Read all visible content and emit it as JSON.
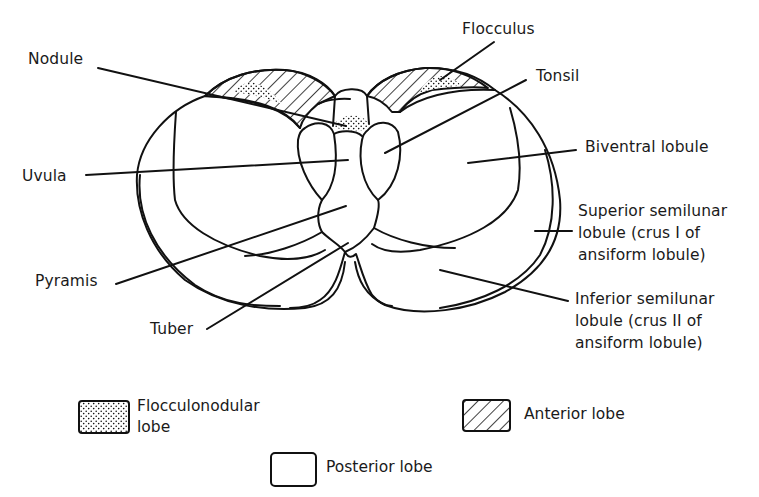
{
  "figure": {
    "labels": {
      "nodule": "Nodule",
      "flocculus": "Flocculus",
      "tonsil": "Tonsil",
      "biventral": "Biventral lobule",
      "uvula": "Uvula",
      "superior_semilunar": [
        "Superior semilunar",
        "lobule (crus I of",
        "ansiform lobule)"
      ],
      "pyramis": "Pyramis",
      "inferior_semilunar": [
        "Inferior semilunar",
        "lobule (crus II of",
        "ansiform lobule)"
      ],
      "tuber": "Tuber"
    }
  },
  "legend": {
    "items": [
      {
        "pattern": "stippled",
        "label_lines": [
          "Flocculonodular",
          "lobe"
        ]
      },
      {
        "pattern": "hatched",
        "label_lines": [
          "Anterior lobe"
        ]
      },
      {
        "pattern": "blank",
        "label_lines": [
          "Posterior lobe"
        ]
      }
    ]
  },
  "colors": {
    "ink": "#111111",
    "background": "#ffffff"
  }
}
